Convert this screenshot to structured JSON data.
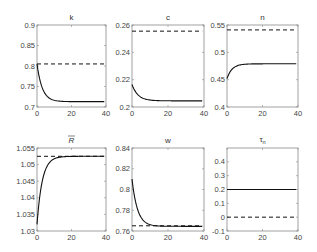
{
  "chart_data": [
    {
      "type": "line",
      "title": "k",
      "xlim": [
        0,
        40
      ],
      "ylim": [
        0.7,
        0.9
      ],
      "xticks": [
        0,
        20,
        40
      ],
      "yticks": [
        0.7,
        0.75,
        0.8,
        0.85,
        0.9
      ],
      "ytick_labels": [
        "0.7",
        "0.75",
        "0.8",
        "0.85",
        "0.9"
      ],
      "series": [
        {
          "name": "transition",
          "style": "solid",
          "start": 0.805,
          "end": 0.713,
          "rate": 0.33
        },
        {
          "name": "reference",
          "style": "dashed",
          "value": 0.805
        }
      ]
    },
    {
      "type": "line",
      "title": "c",
      "xlim": [
        0,
        40
      ],
      "ylim": [
        0.2,
        0.26
      ],
      "xticks": [
        0,
        20,
        40
      ],
      "yticks": [
        0.2,
        0.22,
        0.24,
        0.26
      ],
      "ytick_labels": [
        "0.2",
        "0.22",
        "0.24",
        "0.26"
      ],
      "series": [
        {
          "name": "transition",
          "style": "solid",
          "start": 0.2165,
          "end": 0.2045,
          "rate": 0.3
        },
        {
          "name": "reference",
          "style": "dashed",
          "value": 0.2555
        }
      ]
    },
    {
      "type": "line",
      "title": "n",
      "xlim": [
        0,
        40
      ],
      "ylim": [
        0.4,
        0.55
      ],
      "xticks": [
        0,
        20,
        40
      ],
      "yticks": [
        0.4,
        0.45,
        0.5,
        0.55
      ],
      "ytick_labels": [
        "0.4",
        "0.45",
        "0.5",
        "0.55"
      ],
      "series": [
        {
          "name": "transition",
          "style": "solid",
          "start": 0.452,
          "end": 0.479,
          "rate": 0.35
        },
        {
          "name": "reference",
          "style": "dashed",
          "value": 0.541
        }
      ]
    },
    {
      "type": "line",
      "title": "R̄",
      "xlim": [
        0,
        40
      ],
      "ylim": [
        1.03,
        1.055
      ],
      "xticks": [
        0,
        20,
        40
      ],
      "yticks": [
        1.03,
        1.035,
        1.04,
        1.045,
        1.05,
        1.055
      ],
      "ytick_labels": [
        "1.03",
        "1.035",
        "1.04",
        "1.045",
        "1.05",
        "1.055"
      ],
      "series": [
        {
          "name": "transition",
          "style": "solid",
          "start": 1.032,
          "end": 1.0525,
          "rate": 0.33
        },
        {
          "name": "reference",
          "style": "dashed",
          "value": 1.0525
        }
      ]
    },
    {
      "type": "line",
      "title": "w",
      "xlim": [
        0,
        40
      ],
      "ylim": [
        0.76,
        0.84
      ],
      "xticks": [
        0,
        20,
        40
      ],
      "yticks": [
        0.76,
        0.78,
        0.8,
        0.82,
        0.84
      ],
      "ytick_labels": [
        "0.76",
        "0.78",
        "0.8",
        "0.82",
        "0.84"
      ],
      "series": [
        {
          "name": "transition",
          "style": "solid",
          "start": 0.81,
          "end": 0.7645,
          "rate": 0.33
        },
        {
          "name": "reference",
          "style": "dashed",
          "value": 0.765
        }
      ]
    },
    {
      "type": "line",
      "title": "τn",
      "xlim": [
        0,
        40
      ],
      "ylim": [
        -0.1,
        0.5
      ],
      "xticks": [
        0,
        20,
        40
      ],
      "yticks": [
        -0.1,
        0,
        0.1,
        0.2,
        0.3,
        0.4
      ],
      "ytick_labels": [
        "-0.1",
        "0",
        "0.1",
        "0.2",
        "0.3",
        "0.4"
      ],
      "series": [
        {
          "name": "transition",
          "style": "solid",
          "value": 0.2
        },
        {
          "name": "reference",
          "style": "dashed",
          "value": 0.0
        }
      ]
    }
  ],
  "panels_layout": [
    {
      "x0": 37,
      "x1": 106,
      "y0": 25,
      "y1": 107
    },
    {
      "x0": 132,
      "x1": 204,
      "y0": 25,
      "y1": 107
    },
    {
      "x0": 227,
      "x1": 298,
      "y0": 25,
      "y1": 107
    },
    {
      "x0": 37,
      "x1": 106,
      "y0": 148,
      "y1": 231
    },
    {
      "x0": 132,
      "x1": 204,
      "y0": 148,
      "y1": 231
    },
    {
      "x0": 227,
      "x1": 298,
      "y0": 148,
      "y1": 231
    }
  ],
  "titles": {
    "k": "k",
    "c": "c",
    "n": "n",
    "R": "R",
    "w": "w",
    "tau": "τ",
    "tau_sub": "n"
  }
}
